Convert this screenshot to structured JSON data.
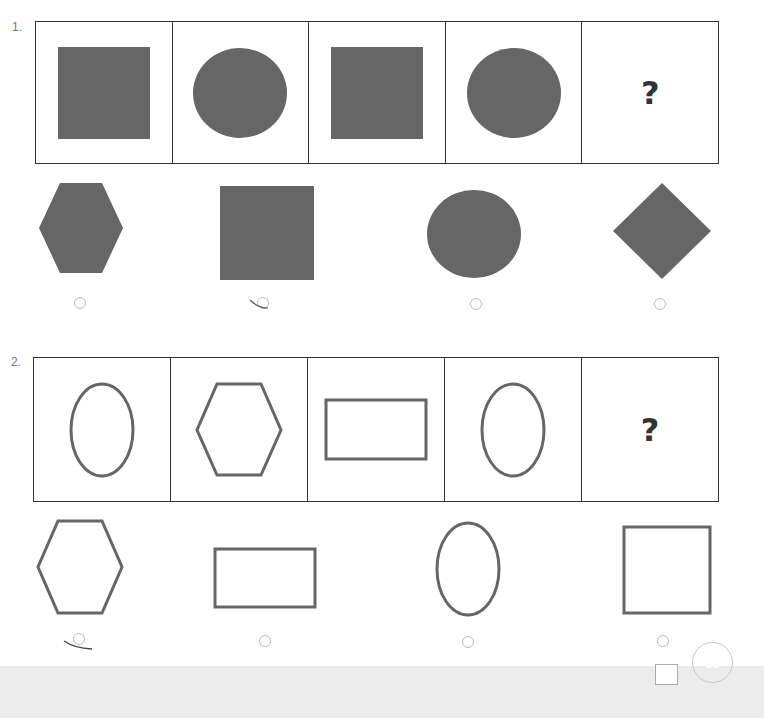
{
  "questions": [
    {
      "number": "1.",
      "sequence": [
        {
          "shape": "square",
          "style": "filled"
        },
        {
          "shape": "circle",
          "style": "filled"
        },
        {
          "shape": "square",
          "style": "filled"
        },
        {
          "shape": "circle",
          "style": "filled"
        },
        {
          "shape": "unknown",
          "label": "?"
        }
      ],
      "options": [
        {
          "shape": "hexagon",
          "style": "filled",
          "selected": false
        },
        {
          "shape": "square",
          "style": "filled",
          "selected": true
        },
        {
          "shape": "circle",
          "style": "filled",
          "selected": false
        },
        {
          "shape": "diamond",
          "style": "filled",
          "selected": false
        }
      ]
    },
    {
      "number": "2.",
      "sequence": [
        {
          "shape": "oval",
          "style": "outline"
        },
        {
          "shape": "hexagon",
          "style": "outline"
        },
        {
          "shape": "rectangle",
          "style": "outline"
        },
        {
          "shape": "oval",
          "style": "outline"
        },
        {
          "shape": "unknown",
          "label": "?"
        }
      ],
      "options": [
        {
          "shape": "hexagon",
          "style": "outline",
          "selected": true
        },
        {
          "shape": "rectangle",
          "style": "outline",
          "selected": false
        },
        {
          "shape": "oval",
          "style": "outline",
          "selected": false
        },
        {
          "shape": "square",
          "style": "outline",
          "selected": false
        }
      ]
    }
  ],
  "footer": {
    "page_number": "35"
  },
  "colors": {
    "fill": "#666666",
    "stroke": "#666666",
    "border": "#333333",
    "footer_bg": "#ececec"
  }
}
